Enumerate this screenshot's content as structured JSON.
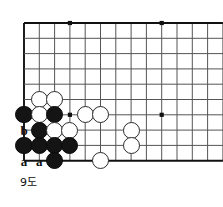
{
  "diagram": {
    "caption": "9도",
    "kind": "go-board-corner-diagram",
    "board": {
      "edges": {
        "left": true,
        "top": true,
        "right": false,
        "bottom": true
      },
      "origin_x": 24,
      "origin_y": 23,
      "spacing": 15.3,
      "cols": 14,
      "rows": 10,
      "line_color": "#555555",
      "edge_color": "#111111",
      "background": "#ffffff"
    },
    "star_points": [
      {
        "col": 4,
        "row": 1
      },
      {
        "col": 10,
        "row": 1
      },
      {
        "col": 4,
        "row": 7
      },
      {
        "col": 10,
        "row": 7
      }
    ],
    "stones": [
      {
        "color": "white",
        "col": 2,
        "row": 6
      },
      {
        "color": "white",
        "col": 3,
        "row": 6
      },
      {
        "color": "black",
        "col": 1,
        "row": 7
      },
      {
        "color": "white",
        "col": 2,
        "row": 7
      },
      {
        "color": "black",
        "col": 3,
        "row": 7
      },
      {
        "color": "white",
        "col": 5,
        "row": 7
      },
      {
        "color": "white",
        "col": 6,
        "row": 7
      },
      {
        "color": "black",
        "col": 2,
        "row": 8
      },
      {
        "color": "white",
        "col": 3,
        "row": 8
      },
      {
        "color": "white",
        "col": 4,
        "row": 8
      },
      {
        "color": "white",
        "col": 8,
        "row": 8
      },
      {
        "color": "black",
        "col": 1,
        "row": 9
      },
      {
        "color": "black",
        "col": 2,
        "row": 9
      },
      {
        "color": "black",
        "col": 3,
        "row": 9
      },
      {
        "color": "black",
        "col": 4,
        "row": 9
      },
      {
        "color": "white",
        "col": 8,
        "row": 9
      },
      {
        "color": "black",
        "col": 3,
        "row": 10
      },
      {
        "color": "white",
        "col": 6,
        "row": 10
      }
    ],
    "labels": [
      {
        "text": "b",
        "col": 1,
        "row": 8
      },
      {
        "text": "a",
        "col": 1,
        "row": 10
      },
      {
        "text": "a",
        "col": 2,
        "row": 10
      }
    ],
    "stone_radius": 8.6,
    "colors": {
      "black_stone": "#141414",
      "white_stone": "#ffffff",
      "white_stone_border": "#2b2b2b",
      "label_text": "#111111"
    }
  }
}
